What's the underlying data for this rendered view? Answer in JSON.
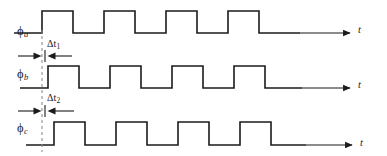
{
  "figure": {
    "type": "timing-diagram",
    "background_color": "#ffffff",
    "line_color": "#1b1b1b",
    "dashed_line_color": "#8e8e8e"
  },
  "waveforms": [
    {
      "id": "phi-a",
      "label_base": "ϕ",
      "label_sub": "a",
      "axis_label": "t",
      "baseline_y": 33,
      "high_y": 11,
      "start_x": 14,
      "first_rise_x": 42,
      "half_period": 31,
      "edges": [
        42,
        73,
        104,
        135,
        166,
        197,
        228,
        259,
        272
      ],
      "axis_end_x": 352,
      "level_sequence": [
        "low",
        "high",
        "low",
        "high",
        "low",
        "high",
        "low",
        "high",
        "low"
      ]
    },
    {
      "id": "phi-b",
      "label_base": "ϕ",
      "label_sub": "b",
      "axis_label": "t",
      "baseline_y": 88,
      "high_y": 66,
      "start_x": 20,
      "first_rise_x": 48,
      "half_period": 31,
      "edges": [
        48,
        79,
        110,
        141,
        172,
        203,
        234,
        265,
        278
      ],
      "axis_end_x": 352,
      "level_sequence": [
        "low",
        "high",
        "low",
        "high",
        "low",
        "high",
        "low",
        "high",
        "low"
      ]
    },
    {
      "id": "phi-c",
      "label_base": "ϕ",
      "label_sub": "c",
      "axis_label": "t",
      "baseline_y": 145,
      "high_y": 122,
      "start_x": 26,
      "first_rise_x": 54,
      "half_period": 31,
      "edges": [
        54,
        85,
        116,
        147,
        178,
        209,
        240,
        271,
        284
      ],
      "axis_end_x": 354,
      "level_sequence": [
        "low",
        "high",
        "low",
        "high",
        "low",
        "high",
        "low",
        "high",
        "low"
      ]
    }
  ],
  "annotations": {
    "reference_line": {
      "name": "phase-reference-dashed-line",
      "x": 42,
      "y_top": 30,
      "y_bottom": 152
    },
    "dimensions": [
      {
        "id": "delta-t1",
        "base": "Δt",
        "sub": "1",
        "from_x": 42,
        "to_x": 48,
        "arrow_y": 56,
        "text_x": 48,
        "text_y": 41
      },
      {
        "id": "delta-t2",
        "base": "Δt",
        "sub": "2",
        "from_x": 42,
        "to_x": 54,
        "arrow_y": 111,
        "text_x": 48,
        "text_y": 95
      }
    ]
  },
  "labels": {
    "phi_a": {
      "base": "ϕ",
      "sub": "a",
      "x": 17,
      "y": 25
    },
    "phi_b": {
      "base": "ϕ",
      "sub": "b",
      "x": 17,
      "y": 68
    },
    "phi_c": {
      "base": "ϕ",
      "sub": "c",
      "x": 17,
      "y": 122
    },
    "t_a": {
      "text": "t",
      "x": 358,
      "y": 25
    },
    "t_b": {
      "text": "t",
      "x": 358,
      "y": 80
    },
    "t_c": {
      "text": "t",
      "x": 360,
      "y": 138
    },
    "delta_t1": {
      "base": "Δt",
      "sub": "1",
      "x": 47,
      "y": 39
    },
    "delta_t2": {
      "base": "Δt",
      "sub": "2",
      "x": 47,
      "y": 93
    }
  }
}
